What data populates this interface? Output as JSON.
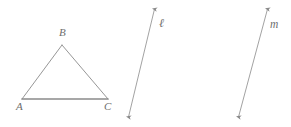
{
  "figure": {
    "background_color": "#ffffff",
    "stroke_color": "#8a8a8a",
    "label_color": "#6e6e6e",
    "width": 291,
    "height": 127
  },
  "triangle": {
    "name": "triangle-ABC",
    "vertices": [
      {
        "id": "A",
        "label": "A",
        "x": 22,
        "y": 99
      },
      {
        "id": "B",
        "label": "B",
        "x": 62,
        "y": 45
      },
      {
        "id": "C",
        "label": "C",
        "x": 108,
        "y": 99
      }
    ],
    "sides": [
      {
        "id": "AB",
        "from": "A",
        "to": "B"
      },
      {
        "id": "BC",
        "from": "B",
        "to": "C"
      },
      {
        "id": "AC",
        "from": "A",
        "to": "C"
      }
    ]
  },
  "lines": [
    {
      "id": "ell",
      "label": "ℓ",
      "x1": 128,
      "y1": 118,
      "x2": 155,
      "y2": 8,
      "arrow_start": true,
      "arrow_end": true
    },
    {
      "id": "m",
      "label": "m",
      "x1": 238,
      "y1": 118,
      "x2": 268,
      "y2": 8,
      "arrow_start": true,
      "arrow_end": true
    }
  ]
}
